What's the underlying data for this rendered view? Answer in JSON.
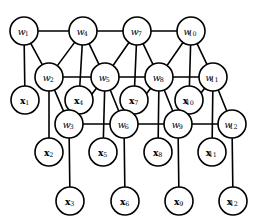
{
  "figure": {
    "kind": "undirected-graphical-model",
    "width": 258,
    "height": 224,
    "background_color": "#ffffff",
    "stroke_color": "#000000",
    "node_fill_color": "#ffffff",
    "node_radius": 14,
    "edge_stroke_width": 1.6
  },
  "nodes": [
    {
      "id": "w1",
      "base": "w",
      "sub": "1",
      "type": "latent",
      "cx": 24,
      "cy": 31,
      "r": 14
    },
    {
      "id": "w4",
      "base": "w",
      "sub": "4",
      "type": "latent",
      "cx": 83,
      "cy": 31,
      "r": 14
    },
    {
      "id": "w7",
      "base": "w",
      "sub": "7",
      "type": "latent",
      "cx": 137,
      "cy": 31,
      "r": 14
    },
    {
      "id": "w10",
      "base": "w",
      "sub": "10",
      "type": "latent",
      "cx": 191,
      "cy": 31,
      "r": 14
    },
    {
      "id": "w2",
      "base": "w",
      "sub": "2",
      "type": "latent",
      "cx": 49,
      "cy": 77,
      "r": 14
    },
    {
      "id": "w5",
      "base": "w",
      "sub": "5",
      "type": "latent",
      "cx": 105,
      "cy": 77,
      "r": 14
    },
    {
      "id": "w8",
      "base": "w",
      "sub": "8",
      "type": "latent",
      "cx": 159,
      "cy": 77,
      "r": 14
    },
    {
      "id": "w11",
      "base": "w",
      "sub": "11",
      "type": "latent",
      "cx": 213,
      "cy": 77,
      "r": 14
    },
    {
      "id": "x1",
      "base": "x",
      "sub": "1",
      "type": "observed",
      "cx": 25,
      "cy": 100,
      "r": 14
    },
    {
      "id": "x4",
      "base": "x",
      "sub": "4",
      "type": "observed",
      "cx": 79,
      "cy": 100,
      "r": 14
    },
    {
      "id": "x7",
      "base": "x",
      "sub": "7",
      "type": "observed",
      "cx": 134,
      "cy": 100,
      "r": 14
    },
    {
      "id": "x10",
      "base": "x",
      "sub": "10",
      "type": "observed",
      "cx": 189,
      "cy": 100,
      "r": 14
    },
    {
      "id": "w3",
      "base": "w",
      "sub": "3",
      "type": "latent",
      "cx": 69,
      "cy": 124,
      "r": 14
    },
    {
      "id": "w6",
      "base": "w",
      "sub": "6",
      "type": "latent",
      "cx": 124,
      "cy": 124,
      "r": 14
    },
    {
      "id": "w9",
      "base": "w",
      "sub": "9",
      "type": "latent",
      "cx": 178,
      "cy": 124,
      "r": 14
    },
    {
      "id": "w12",
      "base": "w",
      "sub": "12",
      "type": "latent",
      "cx": 232,
      "cy": 124,
      "r": 14
    },
    {
      "id": "x2",
      "base": "x",
      "sub": "2",
      "type": "observed",
      "cx": 49,
      "cy": 152,
      "r": 14
    },
    {
      "id": "x5",
      "base": "x",
      "sub": "5",
      "type": "observed",
      "cx": 103,
      "cy": 152,
      "r": 14
    },
    {
      "id": "x8",
      "base": "x",
      "sub": "8",
      "type": "observed",
      "cx": 158,
      "cy": 152,
      "r": 14
    },
    {
      "id": "x11",
      "base": "x",
      "sub": "11",
      "type": "observed",
      "cx": 212,
      "cy": 152,
      "r": 14
    },
    {
      "id": "x3",
      "base": "x",
      "sub": "3",
      "type": "observed",
      "cx": 70,
      "cy": 201,
      "r": 14
    },
    {
      "id": "x6",
      "base": "x",
      "sub": "6",
      "type": "observed",
      "cx": 125,
      "cy": 201,
      "r": 14
    },
    {
      "id": "x9",
      "base": "x",
      "sub": "9",
      "type": "observed",
      "cx": 179,
      "cy": 201,
      "r": 14
    },
    {
      "id": "x12",
      "base": "x",
      "sub": "12",
      "type": "observed",
      "cx": 233,
      "cy": 201,
      "r": 14
    }
  ],
  "edges": [
    {
      "from": "w1",
      "to": "w4"
    },
    {
      "from": "w4",
      "to": "w7"
    },
    {
      "from": "w7",
      "to": "w10"
    },
    {
      "from": "w2",
      "to": "w5"
    },
    {
      "from": "w5",
      "to": "w8"
    },
    {
      "from": "w8",
      "to": "w11"
    },
    {
      "from": "w3",
      "to": "w6"
    },
    {
      "from": "w6",
      "to": "w9"
    },
    {
      "from": "w9",
      "to": "w12"
    },
    {
      "from": "w1",
      "to": "w2"
    },
    {
      "from": "w4",
      "to": "w2"
    },
    {
      "from": "w4",
      "to": "w5"
    },
    {
      "from": "w7",
      "to": "w5"
    },
    {
      "from": "w7",
      "to": "w8"
    },
    {
      "from": "w10",
      "to": "w8"
    },
    {
      "from": "w10",
      "to": "w11"
    },
    {
      "from": "w2",
      "to": "w3"
    },
    {
      "from": "w5",
      "to": "w3"
    },
    {
      "from": "w5",
      "to": "w6"
    },
    {
      "from": "w8",
      "to": "w6"
    },
    {
      "from": "w8",
      "to": "w9"
    },
    {
      "from": "w11",
      "to": "w9"
    },
    {
      "from": "w11",
      "to": "w12"
    },
    {
      "from": "w1",
      "to": "x1"
    },
    {
      "from": "w4",
      "to": "x4"
    },
    {
      "from": "w7",
      "to": "x7"
    },
    {
      "from": "w10",
      "to": "x10"
    },
    {
      "from": "w2",
      "to": "x2"
    },
    {
      "from": "w5",
      "to": "x5"
    },
    {
      "from": "w8",
      "to": "x8"
    },
    {
      "from": "w11",
      "to": "x11"
    },
    {
      "from": "w3",
      "to": "x3"
    },
    {
      "from": "w6",
      "to": "x6"
    },
    {
      "from": "w9",
      "to": "x9"
    },
    {
      "from": "w12",
      "to": "x12"
    }
  ]
}
